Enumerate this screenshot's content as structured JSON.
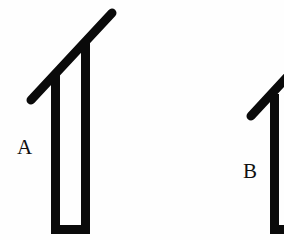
{
  "figures": [
    {
      "id": "A",
      "label": "A"
    },
    {
      "id": "B",
      "label": "B"
    }
  ],
  "colors": {
    "stroke": "#0a0a0a",
    "background": "#fefefe"
  }
}
